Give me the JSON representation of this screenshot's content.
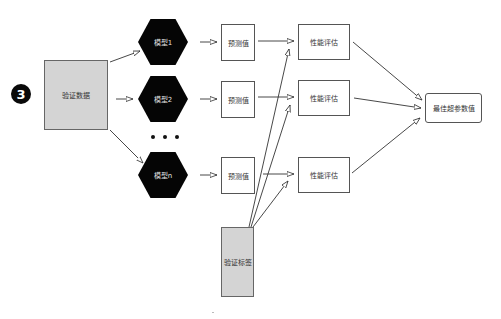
{
  "step_badge": "3",
  "input": {
    "label": "验证数据"
  },
  "models": [
    {
      "label": "模型1"
    },
    {
      "label": "模型2"
    },
    {
      "label": "模型n"
    }
  ],
  "ellipsis": "• • •",
  "predictions": [
    {
      "label": "预测值"
    },
    {
      "label": "预测值"
    },
    {
      "label": "预测值"
    }
  ],
  "evaluations": [
    {
      "label": "性能评估"
    },
    {
      "label": "性能评估"
    },
    {
      "label": "性能评估"
    }
  ],
  "labels_source": {
    "label": "验证标签"
  },
  "output": {
    "label": "最佳超参数值"
  },
  "colors": {
    "hexagon_fill": "#050505",
    "gray_box_fill": "#d4d4d4",
    "line": "#333333"
  }
}
